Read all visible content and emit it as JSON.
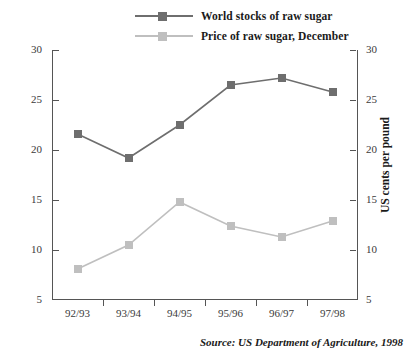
{
  "chart_data": {
    "type": "line",
    "title": "",
    "categories": [
      "92/93",
      "93/94",
      "94/95",
      "95/96",
      "96/97",
      "97/98"
    ],
    "series": [
      {
        "name": "World stocks of raw sugar",
        "color": "#6e6e6e",
        "axis": "left",
        "values": [
          21.6,
          19.2,
          22.5,
          26.5,
          27.2,
          25.8
        ]
      },
      {
        "name": "Price of raw sugar, December",
        "color": "#bfbfbf",
        "axis": "right",
        "values": [
          8.1,
          10.5,
          14.8,
          12.4,
          11.3,
          12.9
        ]
      }
    ],
    "ylabel": "Millions of metric tonnes",
    "y2label": "US cents per pound",
    "xlabel": "",
    "ylim": [
      5,
      30
    ],
    "y2lim": [
      5,
      30
    ],
    "yticks": [
      5,
      10,
      15,
      20,
      25,
      30
    ],
    "y2ticks": [
      5,
      10,
      15,
      20,
      25,
      30
    ],
    "grid": false,
    "legend_position": "top-center"
  },
  "legend": {
    "items": [
      {
        "label": "World stocks of raw sugar",
        "color": "#6e6e6e"
      },
      {
        "label": "Price of raw sugar, December",
        "color": "#bfbfbf"
      }
    ]
  },
  "axes": {
    "left_title": "Millions of metric tonnes",
    "right_title": "US cents per pound",
    "left_ticks": [
      "30",
      "25",
      "20",
      "15",
      "10",
      "5"
    ],
    "right_ticks": [
      "30",
      "25",
      "20",
      "15",
      "10",
      "5"
    ],
    "x_ticks": [
      "92/93",
      "93/94",
      "94/95",
      "95/96",
      "96/97",
      "97/98"
    ]
  },
  "source": {
    "text": "Source: US Department of Agriculture, 1998"
  }
}
